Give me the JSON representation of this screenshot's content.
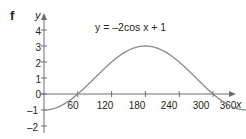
{
  "figure": {
    "label": "f",
    "equation_text": "y = –2cos x + 1",
    "curve_color": "#8a8a8a",
    "axis_color": "#6d6e71",
    "text_color": "#231f20",
    "background": "#ffffff"
  },
  "axes": {
    "x_name": "x",
    "y_name": "y",
    "x_ticks": [
      "60",
      "120",
      "180",
      "240",
      "300",
      "360"
    ],
    "y_ticks": [
      "4",
      "3",
      "2",
      "1",
      "0",
      "–1",
      "–2"
    ]
  },
  "chart_data": {
    "type": "line",
    "title": "",
    "annotations": [
      "y = –2cos x + 1",
      "f"
    ],
    "xlabel": "x",
    "ylabel": "y",
    "xlim": [
      0,
      375
    ],
    "ylim": [
      -2,
      4.4
    ],
    "grid": false,
    "legend": "none",
    "function": "y = -2*cos(x) + 1",
    "x": [
      0,
      15,
      30,
      45,
      60,
      75,
      90,
      105,
      120,
      135,
      150,
      165,
      180,
      195,
      210,
      225,
      240,
      255,
      270,
      285,
      300,
      315,
      330,
      345,
      360,
      375
    ],
    "y": [
      -1,
      -0.93,
      -0.73,
      -0.41,
      0,
      0.48,
      1,
      1.52,
      2,
      2.41,
      2.73,
      2.93,
      3,
      2.93,
      2.73,
      2.41,
      2,
      1.52,
      1,
      0.48,
      0,
      -0.41,
      -0.73,
      -0.93,
      -1,
      -0.93
    ],
    "x_tick_values": [
      60,
      120,
      180,
      240,
      300,
      360
    ],
    "y_tick_values": [
      4,
      3,
      2,
      1,
      0,
      -1,
      -2
    ],
    "amplitude": 2,
    "vertical_shift": 1,
    "period": 360,
    "maximum": {
      "x": 180,
      "y": 3
    },
    "minimum": {
      "x": 0,
      "y": -1
    },
    "zeros": [
      60,
      300
    ]
  }
}
